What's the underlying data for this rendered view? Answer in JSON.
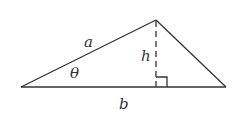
{
  "diagram": {
    "type": "triangle-area",
    "colors": {
      "stroke": "#333333",
      "background": "#ffffff"
    },
    "vertices": {
      "left": [
        21,
        87
      ],
      "apex": [
        156,
        20
      ],
      "right": [
        226,
        87
      ],
      "foot": [
        156,
        87
      ]
    },
    "labels": {
      "side_a": "a",
      "angle": "θ",
      "height": "h",
      "base": "b"
    },
    "right_angle_marker": true
  }
}
